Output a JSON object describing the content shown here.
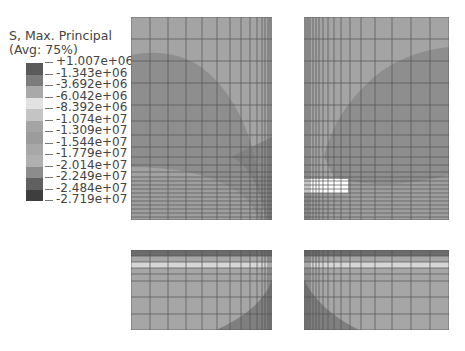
{
  "legend": {
    "title_line1": "S, Max. Principal",
    "title_line2": "(Avg: 75%)",
    "labels": [
      "+1.007e+06",
      "-1.343e+06",
      "-3.692e+06",
      "-6.042e+06",
      "-8.392e+06",
      "-1.074e+07",
      "-1.309e+07",
      "-1.544e+07",
      "-1.779e+07",
      "-2.014e+07",
      "-2.249e+07",
      "-2.484e+07",
      "-2.719e+07"
    ],
    "colors": [
      "#5a5a5a",
      "#7c7c7c",
      "#a9a9a9",
      "#e2e2e2",
      "#c4c4c4",
      "#a4a4a4",
      "#9c9c9c",
      "#a8a8a8",
      "#b0b0b0",
      "#8c8c8c",
      "#606060",
      "#3e3e3e"
    ]
  },
  "panels": {
    "top_left": {
      "region": "upper-left",
      "base_color": "#a3a3a3",
      "contour_color": "#888888"
    },
    "top_right": {
      "region": "upper-right",
      "base_color": "#a3a3a3",
      "contour_color": "#888888"
    },
    "bottom_left": {
      "region": "lower-left",
      "base_color": "#a6a6a6",
      "contour_color": "#7f7f7f"
    },
    "bottom_right": {
      "region": "lower-right",
      "base_color": "#a6a6a6",
      "contour_color": "#7f7f7f"
    }
  }
}
